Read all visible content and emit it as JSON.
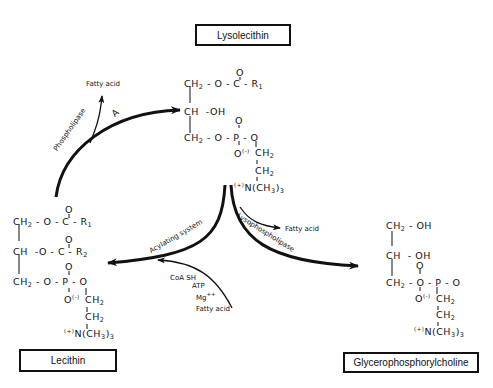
{
  "compounds": {
    "lysolecithin": {
      "name": "Lysolecithin",
      "rows": [
        "CH2 - O - C - R1",
        "CH  - OH",
        "CH2 - O - P - O"
      ],
      "carbonyl_o": "O",
      "phosphate_o_top": "O",
      "phosphate_o_minus": "O(-)",
      "chain": [
        "CH2",
        "CH2",
        "(+)N(CH3)3"
      ]
    },
    "lecithin": {
      "name": "Lecithin",
      "rows": [
        "CH2 - O - C - R1",
        "CH  - O - C - R2",
        "CH2 - O - P - O"
      ],
      "chain": [
        "CH2",
        "CH2",
        "(+)N(CH3)3"
      ]
    },
    "glycerophosphorylcholine": {
      "name": "Glycerophosphorylcholine",
      "rows": [
        "CH2 - OH",
        "CH  - OH",
        "CH2 - O - P - O"
      ],
      "chain": [
        "CH2",
        "CH2",
        "(+)N(CH3)3"
      ]
    }
  },
  "labels": {
    "phospholipase_a": "Phospholipase",
    "phospholipase_a_suffix": "A",
    "acylating_system": "Acylating system",
    "lysophospholipase": "Lysophospholipase",
    "fatty_acid_top": "Fatty acid",
    "fatty_acid_mid": "Fatty acid",
    "fatty_acid_bottom": "Fatty acid",
    "coa_sh": "CoA SH",
    "atp": "ATP",
    "mg": "Mg",
    "mg_charge": "++"
  },
  "chem_text": {
    "ch2": "CH",
    "ch": "CH",
    "o": "O",
    "c": "C",
    "p": "P",
    "oh": "OH",
    "r": "R",
    "n": "N(CH",
    "plus": "(+)",
    "minus": "(-)",
    "one": "1",
    "two": "2",
    "three": "3",
    "dash": "-"
  }
}
